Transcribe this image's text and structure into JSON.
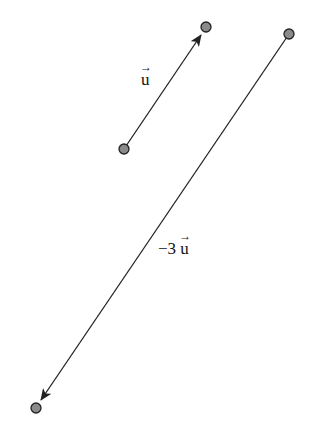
{
  "diagram": {
    "colors": {
      "line": "#222222",
      "point_fill": "#8a8a8a",
      "point_stroke": "#222222"
    },
    "vectors": [
      {
        "name": "u",
        "label_prefix": "",
        "label_var": "u",
        "start": [
          124,
          149
        ],
        "end": [
          206,
          27
        ]
      },
      {
        "name": "-3u",
        "label_prefix": "−3 ",
        "label_var": "u",
        "start": [
          289,
          34
        ],
        "end": [
          36,
          408
        ]
      }
    ],
    "labels": {
      "u": {
        "prefix": "",
        "var": "u",
        "arrow": "→"
      },
      "neg3u": {
        "prefix": "−3",
        "var": "u",
        "arrow": "→"
      }
    }
  }
}
